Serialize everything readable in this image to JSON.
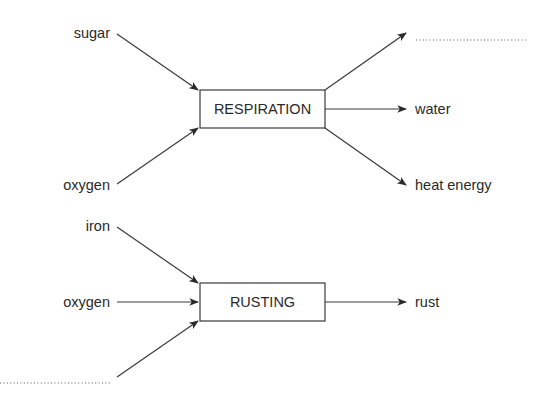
{
  "diagram": {
    "respiration": {
      "process": "RESPIRATION",
      "inputs": [
        "sugar",
        "oxygen"
      ],
      "outputs": [
        "...........................",
        "water",
        "heat energy"
      ],
      "blank_output": true
    },
    "rusting": {
      "process": "RUSTING",
      "inputs": [
        "iron",
        "oxygen",
        "..........................."
      ],
      "outputs": [
        "rust"
      ],
      "blank_input": true
    }
  }
}
